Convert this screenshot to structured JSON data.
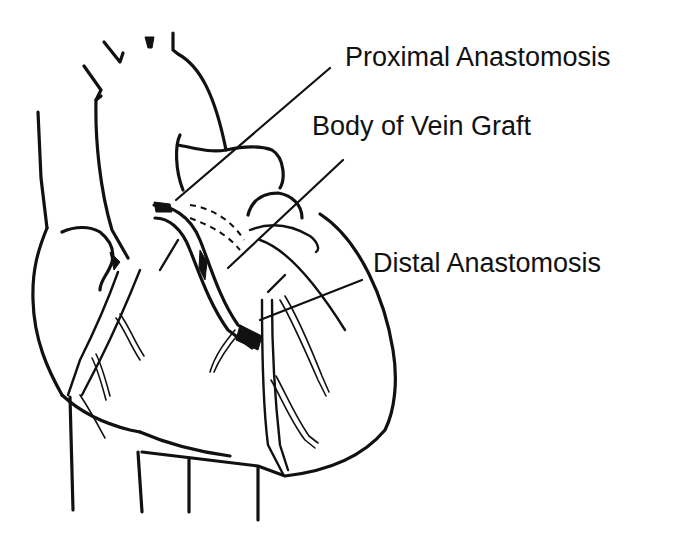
{
  "figure": {
    "labels": [
      {
        "id": "proximal",
        "text": "Proximal Anastomosis",
        "x": 345,
        "y": 44
      },
      {
        "id": "body",
        "text": "Body of Vein Graft",
        "x": 312,
        "y": 113
      },
      {
        "id": "distal",
        "text": "Distal Anastomosis",
        "x": 373,
        "y": 250
      }
    ],
    "leaders": [
      {
        "id": "proximal",
        "from": [
          330,
          68
        ],
        "to": [
          176,
          200
        ]
      },
      {
        "id": "body",
        "from": [
          343,
          160
        ],
        "to": [
          228,
          268
        ]
      },
      {
        "id": "distal",
        "from": [
          362,
          280
        ],
        "to": [
          260,
          320
        ]
      }
    ],
    "colors": {
      "ink": "#111111",
      "background": "#ffffff"
    }
  }
}
